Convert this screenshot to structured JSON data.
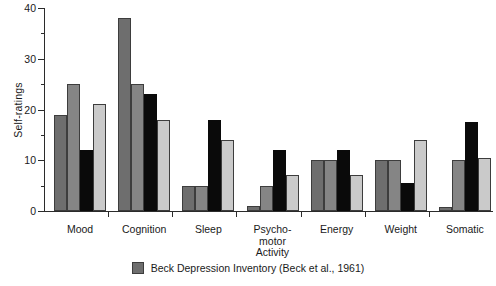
{
  "chart_data": {
    "type": "bar",
    "title": "",
    "xlabel": "",
    "ylabel": "Self-ratings",
    "ylim": [
      0,
      40
    ],
    "yticks": [
      0,
      10,
      20,
      30,
      40
    ],
    "ytick_labels": [
      "0",
      "10",
      "20",
      "30",
      "40"
    ],
    "yminor_ticks": [
      5,
      15,
      25,
      35
    ],
    "grid": false,
    "legend_position": "bottom-center",
    "categories": [
      "Mood",
      "Cognition",
      "Sleep",
      "Psycho-\nmotor\nActivity",
      "Energy",
      "Weight",
      "Somatic"
    ],
    "series": [
      {
        "name": "Beck Depression Inventory (Beck et al., 1961)",
        "color": "#6e6e6e",
        "values": [
          19,
          38,
          5,
          1,
          10,
          10,
          0.8
        ]
      },
      {
        "name": "series-2",
        "color": "#858585",
        "values": [
          25,
          25,
          5,
          5,
          10,
          10,
          10
        ]
      },
      {
        "name": "series-3",
        "color": "#0a0a0a",
        "values": [
          12,
          23,
          18,
          12,
          12,
          5.5,
          17.5
        ]
      },
      {
        "name": "series-4",
        "color": "#cacaca",
        "values": [
          21,
          18,
          14,
          7,
          7,
          14,
          10.5
        ]
      }
    ]
  },
  "legend": {
    "entries": [
      {
        "label": "Beck Depression Inventory (Beck et al., 1961)",
        "color": "#6e6e6e"
      }
    ]
  }
}
